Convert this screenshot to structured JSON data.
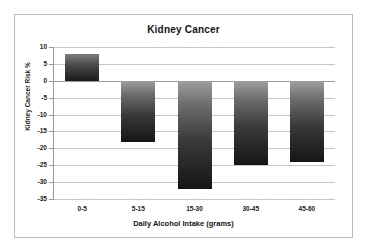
{
  "chart_data": {
    "type": "bar",
    "title": "Kidney Cancer",
    "xlabel": "Daily Alcohol Intake (grams)",
    "ylabel": "Kidney Cancer Risk %",
    "categories": [
      "0-5",
      "5-15",
      "15-30",
      "30-45",
      "45-60"
    ],
    "values": [
      8,
      -18,
      -32,
      -25,
      -24
    ],
    "ylim": [
      -35,
      10
    ],
    "ytick_step": 5,
    "yticks": [
      10,
      5,
      0,
      -5,
      -10,
      -15,
      -20,
      -25,
      -30,
      -35
    ],
    "ytick_labels": [
      "10",
      "5",
      "0",
      "-5",
      "-10",
      "-15",
      "-20",
      "-25",
      "-30",
      "-35"
    ],
    "grid": true,
    "legend": false,
    "series": [
      {
        "name": "Kidney Cancer Risk %",
        "values": [
          8,
          -18,
          -32,
          -25,
          -24
        ]
      }
    ],
    "colors": {
      "bar_top": "#9e9e9e",
      "bar_bottom": "#151515",
      "gridline": "#c6c6c6",
      "axis": "#9a9a9a",
      "text": "#1a1a1a",
      "frame": "#b9b9b9",
      "background": "#ffffff"
    }
  }
}
